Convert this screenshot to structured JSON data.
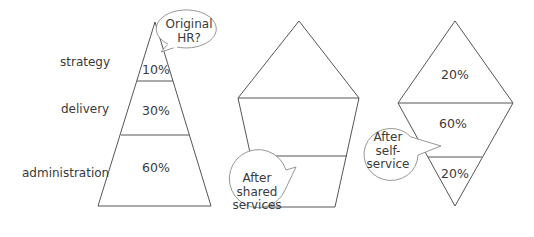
{
  "diagram": {
    "type": "HR structure shapes comparison",
    "row_labels": [
      "strategy",
      "delivery",
      "administration"
    ],
    "shapes": [
      {
        "name": "original-hr",
        "callout": "Original HR?",
        "callout_lines": [
          "Original",
          "HR?"
        ],
        "layers": [
          {
            "level": "strategy",
            "percent": "10%"
          },
          {
            "level": "delivery",
            "percent": "30%"
          },
          {
            "level": "administration",
            "percent": "60%"
          }
        ]
      },
      {
        "name": "after-shared-services",
        "callout": "After shared services",
        "callout_lines": [
          "After",
          "shared",
          "services"
        ],
        "layers": [
          {
            "level": "strategy",
            "percent": ""
          },
          {
            "level": "delivery",
            "percent": ""
          },
          {
            "level": "administration",
            "percent": ""
          }
        ]
      },
      {
        "name": "after-self-service",
        "callout": "After self-service",
        "callout_lines": [
          "After",
          "self-",
          "service"
        ],
        "layers": [
          {
            "level": "strategy",
            "percent": "20%"
          },
          {
            "level": "delivery",
            "percent": "60%"
          },
          {
            "level": "administration",
            "percent": "20%"
          }
        ]
      }
    ]
  },
  "colors": {
    "stroke": "#555555",
    "text": "#3a3a3a",
    "bubble_stroke": "#8a8a8a",
    "background": "#ffffff"
  }
}
